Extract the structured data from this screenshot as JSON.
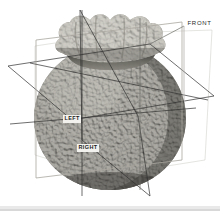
{
  "scene": {
    "title": "3D object orientation view",
    "background_color": "#ffffff",
    "object": {
      "name": "textured-organic-solid",
      "description": "Rounded gourd-like body with ruffled cap",
      "body_color_light": "#b0aea8",
      "body_color_mid": "#8a8881",
      "body_color_dark": "#4e4d49",
      "cap_color_light": "#cfcdc6",
      "cap_color_dark": "#8d8b84"
    },
    "wireframe": {
      "line_color": "#3a3a3a",
      "plane_color": "#b9b7b0",
      "stroke_width": 0.7
    },
    "labels": {
      "front": "FRONT",
      "left": "LEFT",
      "right": "RIGHT"
    }
  }
}
